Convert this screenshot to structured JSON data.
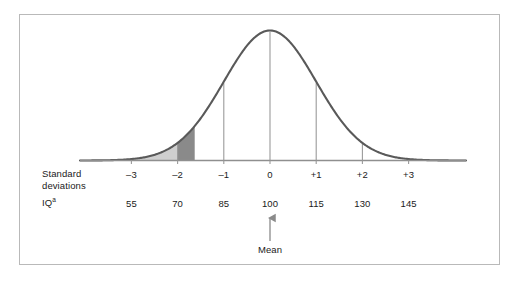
{
  "chart_data": {
    "type": "line",
    "title": "",
    "subtitle": "",
    "xlabel": "",
    "ylabel": "",
    "distribution": {
      "shape": "normal",
      "mean": 100,
      "std_dev": 15,
      "peak_label": "Mean"
    },
    "axis_rows": [
      {
        "row_label": "Standard deviations",
        "row_label_line1": "Standard",
        "row_label_line2": "deviations",
        "values": [
          "–3",
          "–2",
          "–1",
          "0",
          "+1",
          "+2",
          "+3"
        ]
      },
      {
        "row_label": "IQ",
        "row_label_superscript": "a",
        "values": [
          "55",
          "70",
          "85",
          "100",
          "115",
          "130",
          "145"
        ]
      }
    ],
    "x_positions_sd": [
      -3,
      -2,
      -1,
      0,
      1,
      2,
      3
    ],
    "tick_count": 7,
    "shaded_regions": [
      {
        "name": "light-tail-region",
        "from_sd": -4.1,
        "to_sd": -2.0,
        "color": "#cfcfcf",
        "label": ""
      },
      {
        "name": "dark-band-region",
        "from_sd": -2.0,
        "to_sd": -1.63,
        "color": "#8a8a8a",
        "label": ""
      }
    ],
    "annotations": [
      {
        "name": "mean-arrow",
        "text": "Mean",
        "points_to_sd": 0,
        "points_to_value": "100"
      }
    ],
    "legend": {
      "visible": false,
      "entries": []
    },
    "grid": false,
    "ylim": [
      0,
      1
    ]
  },
  "colors": {
    "frame_border": "#b9b9b9",
    "curve": "#595959",
    "axis_line": "#888888",
    "tick_line": "#9a9a9a",
    "shade_light": "#cfcfcf",
    "shade_dark": "#8a8a8a",
    "text": "#1a1a1a",
    "background": "#ffffff",
    "arrow": "#8a8a8a"
  },
  "labels": {
    "sd_row_line1": "Standard",
    "sd_row_line2": "deviations",
    "iq_row": "IQ",
    "iq_row_superscript": "a",
    "mean": "Mean",
    "sd_values": [
      "–3",
      "–2",
      "–1",
      "0",
      "+1",
      "+2",
      "+3"
    ],
    "iq_values": [
      "55",
      "70",
      "85",
      "100",
      "115",
      "130",
      "145"
    ]
  }
}
